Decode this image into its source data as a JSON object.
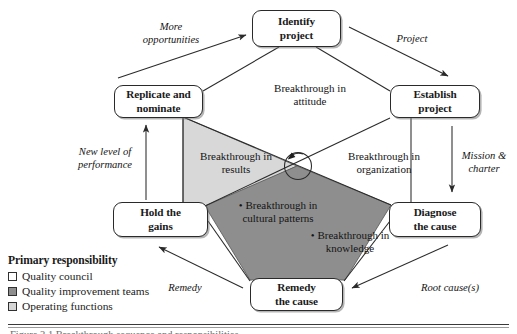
{
  "diagram": {
    "title_caption": "Figure 2.1  Breakthrough sequence and responsibilities",
    "nodes": [
      {
        "id": "identify",
        "label_line1": "Identify",
        "label_line2": "project"
      },
      {
        "id": "replicate",
        "label_line1": "Replicate and",
        "label_line2": "nominate"
      },
      {
        "id": "establish",
        "label_line1": "Establish",
        "label_line2": "project"
      },
      {
        "id": "hold",
        "label_line1": "Hold the",
        "label_line2": "gains"
      },
      {
        "id": "diagnose",
        "label_line1": "Diagnose",
        "label_line2": "the cause"
      },
      {
        "id": "remedy",
        "label_line1": "Remedy",
        "label_line2": "the cause"
      }
    ],
    "edge_labels": [
      {
        "id": "more-opportunities",
        "line1": "More",
        "line2": "opportunities"
      },
      {
        "id": "project",
        "line1": "Project",
        "line2": ""
      },
      {
        "id": "mission-charter",
        "line1": "Mission &",
        "line2": "charter"
      },
      {
        "id": "root-causes",
        "line1": "Root cause(s)",
        "line2": ""
      },
      {
        "id": "remedy-edge",
        "line1": "Remedy",
        "line2": ""
      },
      {
        "id": "new-level",
        "line1": "New level of",
        "line2": "performance"
      }
    ],
    "zone_labels": [
      {
        "id": "attitude",
        "line1": "Breakthrough in",
        "line2": "attitude"
      },
      {
        "id": "results",
        "line1": "Breakthrough in",
        "line2": "results"
      },
      {
        "id": "organization",
        "line1": "Breakthrough in",
        "line2": "organization"
      }
    ],
    "bullet_labels": [
      {
        "id": "cultural-patterns",
        "bullet": "•",
        "line1": "Breakthrough in",
        "line2": "cultural patterns"
      },
      {
        "id": "knowledge",
        "bullet": "•",
        "line1": "Breakthrough in",
        "line2": "knowledge"
      }
    ],
    "legend": {
      "title": "Primary responsibility",
      "items": [
        {
          "id": "quality-council",
          "label": "Quality council",
          "color": "#ffffff"
        },
        {
          "id": "quality-improvement-teams",
          "label": "Quality improvement teams",
          "color": "#8e8e8e"
        },
        {
          "id": "operating-functions",
          "label": "Operating functions",
          "color": "#d6d6d6"
        }
      ]
    },
    "colors": {
      "light_zone": "#d8d8d8",
      "dark_zone": "#8e8e8e",
      "stroke": "#2a2a2a",
      "text": "#141414"
    }
  }
}
